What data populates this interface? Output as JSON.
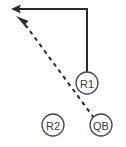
{
  "diagram": {
    "background_color": "#ffffff",
    "line_color": "#2b2b2b",
    "circle_stroke_color": "#4a4a4a",
    "label_color": "#3a3a3a",
    "width": 126,
    "height": 147,
    "players": [
      {
        "id": "r1",
        "label": "R1",
        "cx": 87,
        "cy": 83,
        "r": 11
      },
      {
        "id": "r2",
        "label": "R2",
        "cx": 53,
        "cy": 125,
        "r": 11
      },
      {
        "id": "qb",
        "label": "QB",
        "cx": 101,
        "cy": 125,
        "r": 11
      }
    ],
    "routes": [
      {
        "id": "r1-route",
        "name": "r1-run-route",
        "style": "solid",
        "path": "M 87,72 L 87,9 L 18,9",
        "arrow": {
          "tip_x": 11,
          "tip_y": 9,
          "angle": 180
        }
      },
      {
        "id": "qb-pass",
        "name": "qb-pass-route",
        "style": "dashed",
        "path": "M 94,118 L 24,23",
        "arrow": {
          "tip_x": 16,
          "tip_y": 16,
          "angle": 234
        }
      }
    ]
  }
}
